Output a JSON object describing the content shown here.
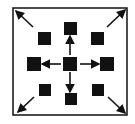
{
  "diagram": {
    "colors": {
      "background": "#ffffff",
      "stroke": "#111111",
      "fill": "#111111"
    },
    "frame": {
      "x": 13,
      "y": 8,
      "width": 114,
      "height": 107
    },
    "squares": [
      {
        "id": "top-left",
        "x": 38,
        "y": 32,
        "size": 13
      },
      {
        "id": "top-center",
        "x": 64,
        "y": 22,
        "size": 13
      },
      {
        "id": "top-right",
        "x": 91,
        "y": 32,
        "size": 13
      },
      {
        "id": "middle-left",
        "x": 27,
        "y": 57,
        "size": 14
      },
      {
        "id": "center",
        "x": 63,
        "y": 57,
        "size": 14
      },
      {
        "id": "middle-right",
        "x": 100,
        "y": 57,
        "size": 14
      },
      {
        "id": "bottom-left",
        "x": 39,
        "y": 84,
        "size": 12
      },
      {
        "id": "bottom-center",
        "x": 65,
        "y": 93,
        "size": 12
      },
      {
        "id": "bottom-right",
        "x": 92,
        "y": 84,
        "size": 12
      }
    ],
    "arrows": [
      {
        "id": "arrow-up",
        "x1": 70,
        "y1": 55,
        "x2": 70,
        "y2": 36
      },
      {
        "id": "arrow-down",
        "x1": 70,
        "y1": 72,
        "x2": 70,
        "y2": 92
      },
      {
        "id": "arrow-left",
        "x1": 61,
        "y1": 64,
        "x2": 42,
        "y2": 64
      },
      {
        "id": "arrow-right",
        "x1": 80,
        "y1": 64,
        "x2": 99,
        "y2": 64
      },
      {
        "id": "arrow-top-left",
        "x1": 33,
        "y1": 27,
        "x2": 16,
        "y2": 11
      },
      {
        "id": "arrow-top-right",
        "x1": 107,
        "y1": 27,
        "x2": 125,
        "y2": 10
      },
      {
        "id": "arrow-bottom-left",
        "x1": 34,
        "y1": 97,
        "x2": 18,
        "y2": 112
      },
      {
        "id": "arrow-bottom-right",
        "x1": 108,
        "y1": 97,
        "x2": 125,
        "y2": 113
      }
    ]
  }
}
